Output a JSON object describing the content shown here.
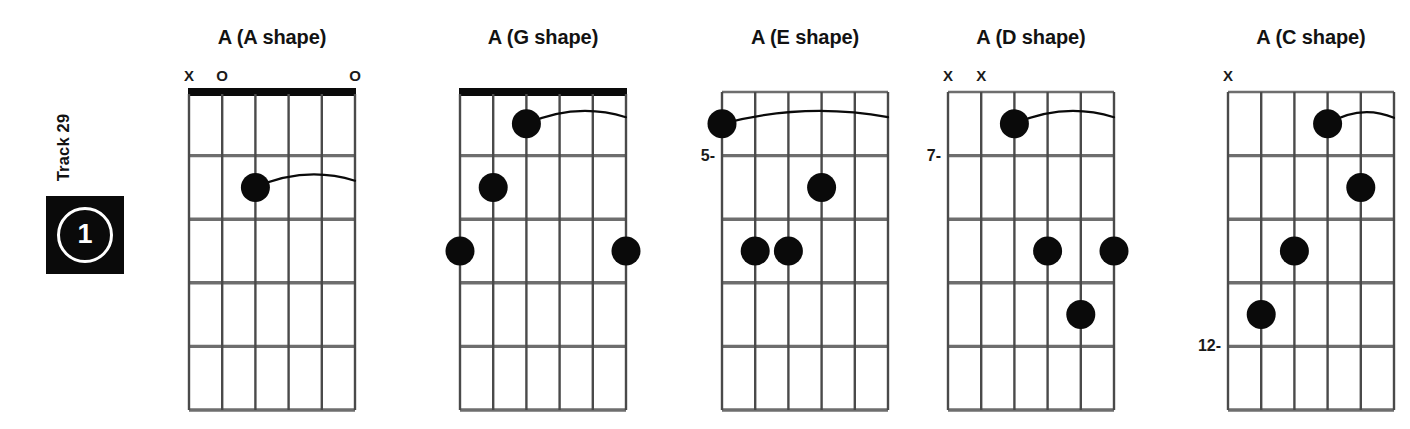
{
  "track": {
    "label": "Track 29",
    "number": "1"
  },
  "diagram_spec": {
    "strings": 6,
    "frets": 5,
    "grid_width": 166,
    "grid_height": 318,
    "grid_top": 92,
    "open_symbol": "O",
    "muted_symbol": "X",
    "dot_color": "#0a0a0a",
    "line_color": "#6e6e6e",
    "nut_color": "#0a0a0a"
  },
  "chords": [
    {
      "title": "A (A shape)",
      "left": 147,
      "has_nut": true,
      "position_label": "",
      "position_fret": 0,
      "markers": [
        {
          "string": 1,
          "symbol": "X"
        },
        {
          "string": 2,
          "symbol": "O"
        },
        {
          "string": 6,
          "symbol": "O"
        }
      ],
      "dots": [
        {
          "string": 3,
          "fret": 2
        }
      ],
      "barre": {
        "fret": 2,
        "from_string": 3,
        "to_string": 6
      }
    },
    {
      "title": "A (G shape)",
      "left": 418,
      "has_nut": true,
      "position_label": "",
      "position_fret": 0,
      "markers": [],
      "dots": [
        {
          "string": 3,
          "fret": 1
        },
        {
          "string": 2,
          "fret": 2
        },
        {
          "string": 1,
          "fret": 3
        },
        {
          "string": 6,
          "fret": 3
        }
      ],
      "barre": {
        "fret": 1,
        "from_string": 3,
        "to_string": 6
      }
    },
    {
      "title": "A (E shape)",
      "left": 680,
      "has_nut": false,
      "position_label": "5-",
      "position_fret": 1,
      "markers": [],
      "dots": [
        {
          "string": 1,
          "fret": 1
        },
        {
          "string": 4,
          "fret": 2
        },
        {
          "string": 2,
          "fret": 3
        },
        {
          "string": 3,
          "fret": 3
        }
      ],
      "barre": {
        "fret": 1,
        "from_string": 1,
        "to_string": 6
      }
    },
    {
      "title": "A (D shape)",
      "left": 906,
      "has_nut": false,
      "position_label": "7-",
      "position_fret": 1,
      "markers": [
        {
          "string": 1,
          "symbol": "X"
        },
        {
          "string": 2,
          "symbol": "X"
        }
      ],
      "dots": [
        {
          "string": 3,
          "fret": 1
        },
        {
          "string": 4,
          "fret": 3
        },
        {
          "string": 6,
          "fret": 3
        },
        {
          "string": 5,
          "fret": 4
        }
      ],
      "barre": {
        "fret": 1,
        "from_string": 3,
        "to_string": 6
      }
    },
    {
      "title": "A (C shape)",
      "left": 1186,
      "has_nut": false,
      "position_label": "12-",
      "position_fret": 4,
      "markers": [
        {
          "string": 1,
          "symbol": "X"
        }
      ],
      "dots": [
        {
          "string": 4,
          "fret": 1
        },
        {
          "string": 5,
          "fret": 2
        },
        {
          "string": 3,
          "fret": 3
        },
        {
          "string": 2,
          "fret": 4
        }
      ],
      "barre": {
        "fret": 1,
        "from_string": 4,
        "to_string": 6
      }
    }
  ]
}
